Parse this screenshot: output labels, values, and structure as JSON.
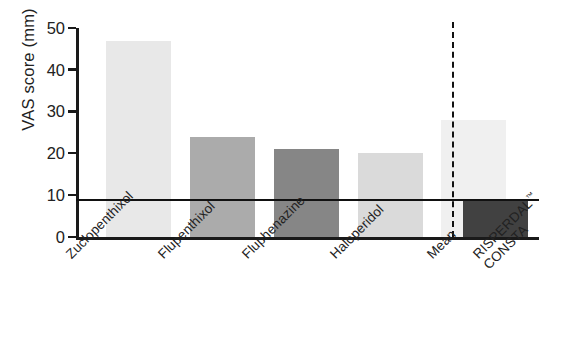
{
  "chart_data": {
    "type": "bar",
    "title": "",
    "subtitle": "",
    "xlabel": "",
    "ylabel": "VAS score (mm)",
    "categories": [
      "Zuclopenthixol",
      "Flupenthixol",
      "Fluphenazine",
      "Haloperidol",
      "Mean",
      "RISPERDAL CONSTA™"
    ],
    "values": [
      47,
      24,
      21,
      20,
      28,
      9
    ],
    "bar_colors": [
      "#e8e8e8",
      "#ababab",
      "#868686",
      "#dadada",
      "#f0f0f0",
      "#414141"
    ],
    "ylim": [
      0,
      50
    ],
    "yticks": [
      0,
      10,
      20,
      30,
      40,
      50
    ],
    "ytick_labels": [
      "0",
      "10",
      "20",
      "30",
      "40",
      "50"
    ],
    "grid": false,
    "legend": "none",
    "annotations": {
      "reference_line_value": 9.2,
      "reference_line_style": "solid",
      "separator_after_category": "Mean",
      "separator_style": "dashed"
    }
  },
  "axis": {
    "y_title": "VAS score (mm)"
  },
  "labels": {
    "cat0": "Zuclopenthixol",
    "cat1": "Flupenthixol",
    "cat2": "Fluphenazine",
    "cat3": "Haloperidol",
    "cat4": "Mean",
    "cat5_line1": "RISPERDAL",
    "cat5_line2": "CONSTA",
    "cat5_tm": "™"
  },
  "ticks": {
    "t0": "0",
    "t1": "10",
    "t2": "20",
    "t3": "30",
    "t4": "40",
    "t5": "50"
  }
}
